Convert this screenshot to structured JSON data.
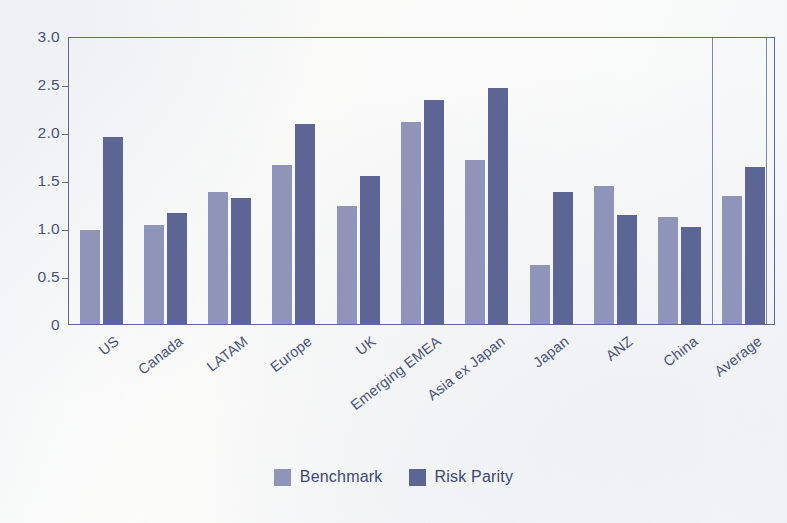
{
  "chart_data": {
    "type": "bar",
    "title": "",
    "xlabel": "",
    "ylabel": "",
    "ylim": [
      0,
      3.0
    ],
    "yticks": [
      "0",
      "0.5",
      "1.0",
      "1.5",
      "2.0",
      "2.5",
      "3.0"
    ],
    "ytick_values": [
      0,
      0.5,
      1.0,
      1.5,
      2.0,
      2.5,
      3.0
    ],
    "grid": false,
    "legend_position": "bottom-center",
    "categories": [
      "US",
      "Canada",
      "LATAM",
      "Europe",
      "UK",
      "Emerging EMEA",
      "Asia ex Japan",
      "Japan",
      "ANZ",
      "China",
      "Average"
    ],
    "series": [
      {
        "name": "Benchmark",
        "color": "#8f94b8",
        "values": [
          0.98,
          1.03,
          1.38,
          1.66,
          1.23,
          2.1,
          1.71,
          0.61,
          1.44,
          1.11,
          1.33
        ]
      },
      {
        "name": "Risk Parity",
        "color": "#5c6594",
        "values": [
          1.95,
          1.16,
          1.31,
          2.08,
          1.54,
          2.33,
          2.46,
          1.37,
          1.14,
          1.01,
          1.64
        ]
      }
    ],
    "annotations": {
      "separator_before_category": "Average",
      "separator_count": 2
    }
  },
  "legend": {
    "items": [
      {
        "label": "Benchmark",
        "swatch": "benchmark"
      },
      {
        "label": "Risk Parity",
        "swatch": "riskparity"
      }
    ]
  },
  "colors": {
    "benchmark": "#8f94b8",
    "risk_parity": "#5c6594",
    "axis": "#5e6894",
    "text": "#4a5278",
    "background": "#fdfdfb"
  }
}
